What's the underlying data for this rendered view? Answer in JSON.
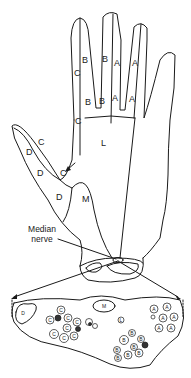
{
  "diagram": {
    "hand_labels": [
      {
        "id": "index-c-upper",
        "text": "C",
        "x": 74,
        "y": 73
      },
      {
        "id": "index-b-upper",
        "text": "B",
        "x": 82,
        "y": 62
      },
      {
        "id": "middle-b-upper",
        "text": "B",
        "x": 102,
        "y": 61
      },
      {
        "id": "middle-a-upper",
        "text": "A",
        "x": 114,
        "y": 65
      },
      {
        "id": "ring-a-upper",
        "text": "A",
        "x": 132,
        "y": 65
      },
      {
        "id": "index-b-lower",
        "text": "B",
        "x": 85,
        "y": 104
      },
      {
        "id": "middle-b-lower",
        "text": "B",
        "x": 99,
        "y": 103
      },
      {
        "id": "middle-a-lower",
        "text": "A",
        "x": 112,
        "y": 100
      },
      {
        "id": "ring-a-lower",
        "text": "A",
        "x": 129,
        "y": 101
      },
      {
        "id": "index-c-base",
        "text": "C",
        "x": 75,
        "y": 123
      },
      {
        "id": "index-c-palm",
        "text": "C",
        "x": 75,
        "y": 140
      },
      {
        "id": "palm-l",
        "text": "L",
        "x": 101,
        "y": 143
      },
      {
        "id": "thumb-d-1",
        "text": "D",
        "x": 26,
        "y": 153
      },
      {
        "id": "thumb-c-1",
        "text": "C",
        "x": 38,
        "y": 146
      },
      {
        "id": "thumb-d-2",
        "text": "D",
        "x": 38,
        "y": 175
      },
      {
        "id": "thumb-c-2",
        "text": "C",
        "x": 60,
        "y": 175
      },
      {
        "id": "thumb-d-3",
        "text": "D",
        "x": 57,
        "y": 199
      },
      {
        "id": "thenar-m",
        "text": "M",
        "x": 83,
        "y": 200
      }
    ],
    "nerve_label": {
      "line1": "Median",
      "line2": "nerve"
    },
    "cross_section": {
      "fascicles": [
        {
          "text": "D",
          "x": 23,
          "y": 316,
          "r": 0
        },
        {
          "text": "M",
          "x": 104,
          "y": 305,
          "r": 0
        },
        {
          "text": "C",
          "x": 61,
          "y": 310,
          "r": 4
        },
        {
          "text": "C",
          "x": 50,
          "y": 320,
          "r": 4
        },
        {
          "text": "C",
          "x": 68,
          "y": 318,
          "r": 4
        },
        {
          "text": "C",
          "x": 77,
          "y": 322,
          "r": 4
        },
        {
          "text": "C",
          "x": 67,
          "y": 328,
          "r": 4
        },
        {
          "text": "C",
          "x": 54,
          "y": 334,
          "r": 4
        },
        {
          "text": "C",
          "x": 64,
          "y": 338,
          "r": 4
        },
        {
          "text": "C",
          "x": 74,
          "y": 337,
          "r": 4
        },
        {
          "text": "A",
          "x": 154,
          "y": 309,
          "r": 4
        },
        {
          "text": "A",
          "x": 167,
          "y": 307,
          "r": 4
        },
        {
          "text": "A",
          "x": 163,
          "y": 318,
          "r": 4
        },
        {
          "text": "A",
          "x": 174,
          "y": 317,
          "r": 4
        },
        {
          "text": "A",
          "x": 159,
          "y": 328,
          "r": 4
        },
        {
          "text": "A",
          "x": 171,
          "y": 328,
          "r": 4
        },
        {
          "text": "B",
          "x": 124,
          "y": 340,
          "r": 4
        },
        {
          "text": "B",
          "x": 132,
          "y": 333,
          "r": 3.5
        },
        {
          "text": "B",
          "x": 141,
          "y": 339,
          "r": 3.5
        },
        {
          "text": "B",
          "x": 134,
          "y": 347,
          "r": 3.5
        },
        {
          "text": "B",
          "x": 117,
          "y": 350,
          "r": 3.5
        },
        {
          "text": "B",
          "x": 128,
          "y": 355,
          "r": 4
        },
        {
          "text": "B",
          "x": 139,
          "y": 353,
          "r": 4
        },
        {
          "text": "B",
          "x": 118,
          "y": 358,
          "r": 3.5
        },
        {
          "text": "L",
          "x": 121,
          "y": 320,
          "r": 3
        }
      ]
    }
  }
}
